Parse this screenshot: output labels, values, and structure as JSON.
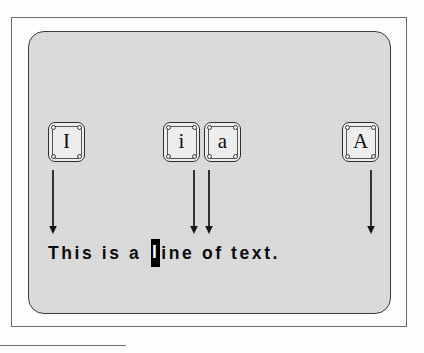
{
  "figure": {
    "background_color": "#fdfdfd",
    "panel_color": "#dcdcdc",
    "ink_color": "#111111"
  },
  "keys": [
    {
      "id": "key-capital-i",
      "label": "I",
      "x": 48,
      "y": 122
    },
    {
      "id": "key-lowercase-i",
      "label": "i",
      "x": 163,
      "y": 122
    },
    {
      "id": "key-lowercase-a",
      "label": "a",
      "x": 204,
      "y": 122
    },
    {
      "id": "key-capital-a",
      "label": "A",
      "x": 342,
      "y": 122
    }
  ],
  "arrows": [
    {
      "id": "arrow-from-capital-i",
      "x": 53,
      "top": 170,
      "bottom": 233
    },
    {
      "id": "arrow-from-lowercase-i",
      "x": 194,
      "top": 170,
      "bottom": 233
    },
    {
      "id": "arrow-from-lowercase-a",
      "x": 208,
      "top": 170,
      "bottom": 233
    },
    {
      "id": "arrow-from-capital-a",
      "x": 371,
      "top": 170,
      "bottom": 233
    }
  ],
  "text_line": {
    "before_cursor": "This is a ",
    "cursor_char": "l",
    "after_cursor": "ine of text.",
    "full_text": "This is a line of text.",
    "cursor_background": "#000000",
    "cursor_foreground": "#ffffff"
  },
  "bottom_rule": {
    "width_px": 126,
    "color": "#6d6d6d"
  }
}
